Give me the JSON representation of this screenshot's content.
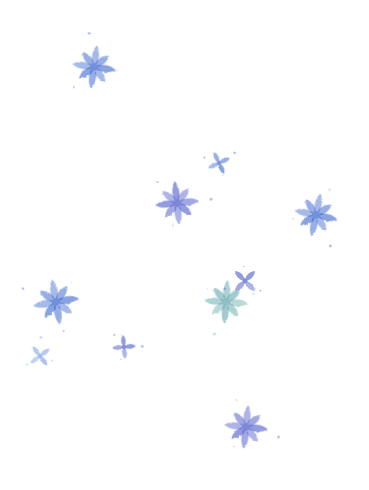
{
  "background": "#ffffff",
  "palette": {
    "blue": "#6f8fdc",
    "blue_light": "#9ab4ea",
    "violet": "#7d86d8",
    "teal": "#8cc0c4",
    "teal_light": "#b5d8d6"
  },
  "snowflakes": [
    {
      "name": "snowflake-top-left",
      "kind": "star8",
      "color": "blue"
    },
    {
      "name": "snowflake-small-cross-center",
      "kind": "cross4",
      "color": "blue"
    },
    {
      "name": "snowflake-center",
      "kind": "star8",
      "color": "violet"
    },
    {
      "name": "snowflake-right",
      "kind": "star8",
      "color": "blue"
    },
    {
      "name": "snowflake-teal",
      "kind": "star8",
      "color": "teal"
    },
    {
      "name": "snowflake-small-cross-teal",
      "kind": "cross4",
      "color": "violet"
    },
    {
      "name": "snowflake-left",
      "kind": "star8",
      "color": "blue"
    },
    {
      "name": "snowflake-small-cross-left",
      "kind": "cross4",
      "color": "blue_light"
    },
    {
      "name": "snowflake-small-cross-middle",
      "kind": "cross4",
      "color": "violet"
    },
    {
      "name": "snowflake-bottom",
      "kind": "star8",
      "color": "violet"
    }
  ]
}
